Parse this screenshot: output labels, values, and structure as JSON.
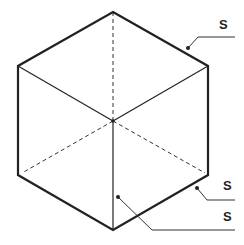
{
  "diagram": {
    "type": "isometric-cube",
    "labels": [
      {
        "id": "top-edge",
        "text": "S"
      },
      {
        "id": "lower-right-edge",
        "text": "S"
      },
      {
        "id": "front-face",
        "text": "S"
      }
    ]
  }
}
